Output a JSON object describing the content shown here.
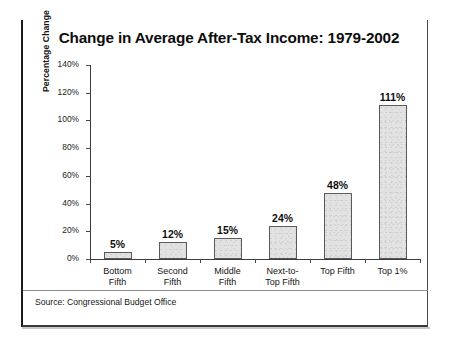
{
  "slide": {
    "source_note": "Source: Congressional Budget Office"
  },
  "chart_data": {
    "type": "bar",
    "title": "Change in Average After-Tax Income: 1979-2002",
    "xlabel": "",
    "ylabel": "Percentage Change",
    "ylim": [
      0,
      140
    ],
    "ytick_labels": [
      "0%",
      "20%",
      "40%",
      "60%",
      "80%",
      "100%",
      "120%",
      "140%"
    ],
    "yticks": [
      0,
      20,
      40,
      60,
      80,
      100,
      120,
      140
    ],
    "grid": false,
    "legend": "none",
    "categories": [
      "Bottom\nFifth",
      "Second\nFifth",
      "Middle\nFifth",
      "Next-to-\nTop Fifth",
      "Top Fifth",
      "Top 1%"
    ],
    "category_lines": [
      [
        "Bottom",
        "Fifth"
      ],
      [
        "Second",
        "Fifth"
      ],
      [
        "Middle",
        "Fifth"
      ],
      [
        "Next-to-",
        "Top Fifth"
      ],
      [
        "Top Fifth",
        ""
      ],
      [
        "Top 1%",
        ""
      ]
    ],
    "values": [
      5,
      12,
      15,
      24,
      48,
      111
    ],
    "value_labels": [
      "5%",
      "12%",
      "15%",
      "24%",
      "48%",
      "111%"
    ],
    "bar_fill": "#e2e2e2",
    "bar_edge": "#5a5a5a",
    "text_color": "#111111"
  }
}
